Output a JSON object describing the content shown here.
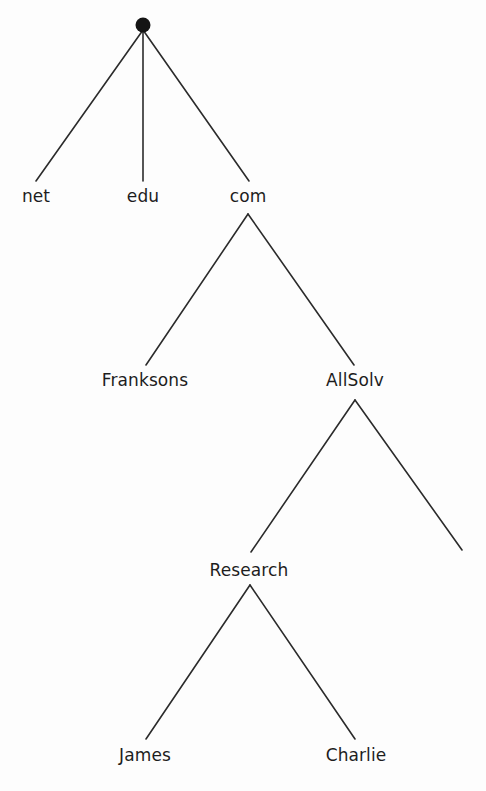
{
  "diagram": {
    "type": "tree",
    "title": "",
    "background_color": "#fdfdfd",
    "line_color": "#2b2b2b",
    "text_color": "#1d1d1d",
    "root": {
      "name": "root-node",
      "label": "",
      "shape": "filled-circle",
      "x": 143,
      "y": 25,
      "radius": 7
    },
    "nodes": [
      {
        "id": "net",
        "label": "net",
        "x": 36,
        "y": 203,
        "level": 1
      },
      {
        "id": "edu",
        "label": "edu",
        "x": 143,
        "y": 203,
        "level": 1
      },
      {
        "id": "com",
        "label": "com",
        "x": 248,
        "y": 203,
        "level": 1
      },
      {
        "id": "franksons",
        "label": "Franksons",
        "x": 145,
        "y": 387,
        "level": 2
      },
      {
        "id": "allsolv",
        "label": "AllSolv",
        "x": 355,
        "y": 387,
        "level": 2
      },
      {
        "id": "research",
        "label": "Research",
        "x": 249,
        "y": 577,
        "level": 3
      },
      {
        "id": "james",
        "label": "James",
        "x": 145,
        "y": 762,
        "level": 4
      },
      {
        "id": "charlie",
        "label": "Charlie",
        "x": 356,
        "y": 762,
        "level": 4
      }
    ],
    "edges": [
      {
        "id": "root-net",
        "from": "root",
        "to": "net",
        "x1": 143,
        "y1": 30,
        "x2": 36,
        "y2": 181
      },
      {
        "id": "root-edu",
        "from": "root",
        "to": "edu",
        "x1": 143,
        "y1": 30,
        "x2": 143,
        "y2": 181
      },
      {
        "id": "root-com",
        "from": "root",
        "to": "com",
        "x1": 143,
        "y1": 30,
        "x2": 249,
        "y2": 181
      },
      {
        "id": "com-franksons",
        "from": "com",
        "to": "franksons",
        "x1": 248,
        "y1": 214,
        "x2": 146,
        "y2": 365
      },
      {
        "id": "com-allsolv",
        "from": "com",
        "to": "allsolv",
        "x1": 248,
        "y1": 214,
        "x2": 354,
        "y2": 365
      },
      {
        "id": "allsolv-research",
        "from": "allsolv",
        "to": "research",
        "x1": 355,
        "y1": 400,
        "x2": 251,
        "y2": 552
      },
      {
        "id": "allsolv-unlabeled",
        "from": "allsolv",
        "to": "",
        "x1": 355,
        "y1": 400,
        "x2": 462,
        "y2": 550
      },
      {
        "id": "research-james",
        "from": "research",
        "to": "james",
        "x1": 250,
        "y1": 585,
        "x2": 146,
        "y2": 739
      },
      {
        "id": "research-charlie",
        "from": "research",
        "to": "charlie",
        "x1": 250,
        "y1": 585,
        "x2": 355,
        "y2": 739
      }
    ]
  }
}
